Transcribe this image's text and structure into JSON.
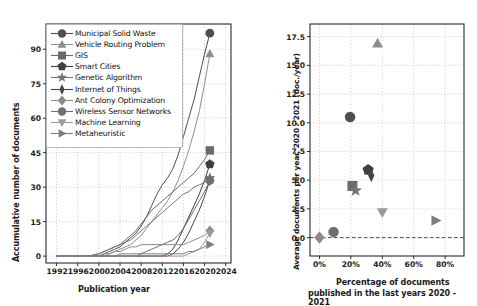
{
  "figure": {
    "title": "",
    "panels": [
      "accumulative-documents",
      "average-vs-percentage"
    ]
  },
  "series_names": [
    "Municipal Solid Waste",
    "Vehicle Routing Problem",
    "GIS",
    "Smart Cities",
    "Genetic Algorithm",
    "Internet of Things",
    "Ant Colony Optimization",
    "Wireless Sensor Networks",
    "Machine Learning",
    "Metaheuristic"
  ],
  "markers": [
    "circle",
    "triangle-up",
    "square",
    "pentagon",
    "star",
    "thin-diamond",
    "diamond",
    "circle",
    "triangle-down",
    "triangle-right"
  ],
  "colors": [
    "#4f4f4f",
    "#8e8e8e",
    "#6a6a6a",
    "#3f3f3f",
    "#757575",
    "#454545",
    "#8a8a8a",
    "#6f6f6f",
    "#9b9b9b",
    "#7e7e7e"
  ],
  "chart_data": [
    {
      "type": "line",
      "id": "accumulative-documents",
      "title": "",
      "xlabel": "Publication year",
      "ylabel": "Accumulative number of documents",
      "xlim": [
        1990,
        2025
      ],
      "ylim": [
        -3,
        101
      ],
      "xticks": [
        1992,
        1996,
        2000,
        2004,
        2008,
        2012,
        2016,
        2020,
        2024
      ],
      "yticks": [
        0,
        15,
        30,
        45,
        60,
        75,
        90
      ],
      "grid": true,
      "legend_position": "upper-left",
      "x": [
        1992,
        1994,
        1996,
        1998,
        2000,
        2001,
        2002,
        2003,
        2004,
        2005,
        2006,
        2007,
        2008,
        2009,
        2010,
        2011,
        2012,
        2013,
        2014,
        2015,
        2016,
        2017,
        2018,
        2019,
        2020,
        2021
      ],
      "series": [
        {
          "name": "Municipal Solid Waste",
          "values": [
            0,
            0,
            0,
            0,
            0,
            1,
            2,
            3,
            4,
            6,
            8,
            10,
            13,
            17,
            22,
            27,
            31,
            34,
            38,
            44,
            52,
            60,
            68,
            78,
            88,
            97
          ],
          "end": 97
        },
        {
          "name": "Vehicle Routing Problem",
          "values": [
            0,
            0,
            0,
            0,
            0,
            0,
            1,
            2,
            3,
            4,
            5,
            7,
            9,
            12,
            15,
            18,
            21,
            24,
            28,
            33,
            39,
            46,
            54,
            63,
            75,
            88
          ],
          "end": 88
        },
        {
          "name": "GIS",
          "values": [
            0,
            0,
            0,
            0,
            1,
            2,
            3,
            4,
            5,
            7,
            9,
            11,
            14,
            17,
            20,
            22,
            24,
            26,
            28,
            30,
            32,
            34,
            36,
            39,
            42,
            46
          ],
          "end": 46
        },
        {
          "name": "Smart Cities",
          "values": [
            0,
            0,
            0,
            0,
            0,
            0,
            0,
            0,
            0,
            0,
            0,
            0,
            0,
            0,
            0,
            0,
            0,
            1,
            3,
            7,
            12,
            17,
            22,
            27,
            33,
            40
          ],
          "end": 40
        },
        {
          "name": "Genetic Algorithm",
          "values": [
            0,
            0,
            0,
            0,
            1,
            2,
            3,
            4,
            5,
            6,
            7,
            9,
            11,
            13,
            15,
            17,
            19,
            21,
            23,
            25,
            27,
            28,
            30,
            31,
            32,
            34
          ],
          "end": 34
        },
        {
          "name": "Internet of Things",
          "values": [
            0,
            0,
            0,
            0,
            0,
            0,
            0,
            0,
            0,
            0,
            0,
            0,
            0,
            0,
            0,
            0,
            0,
            0,
            1,
            3,
            6,
            10,
            15,
            20,
            26,
            33
          ],
          "end": 33
        },
        {
          "name": "Ant Colony Optimization",
          "values": [
            0,
            0,
            0,
            0,
            0,
            1,
            1,
            2,
            2,
            3,
            4,
            4,
            5,
            5,
            5,
            5,
            5,
            5,
            5,
            5,
            5,
            6,
            7,
            8,
            9,
            11
          ],
          "end": 11
        },
        {
          "name": "Wireless Sensor Networks",
          "values": [
            0,
            0,
            0,
            0,
            0,
            0,
            0,
            0,
            0,
            0,
            0,
            0,
            1,
            2,
            3,
            4,
            5,
            6,
            7,
            9,
            12,
            16,
            20,
            24,
            28,
            33
          ],
          "end": 33
        },
        {
          "name": "Machine Learning",
          "values": [
            0,
            0,
            0,
            0,
            0,
            0,
            0,
            0,
            0,
            0,
            0,
            0,
            0,
            0,
            0,
            0,
            0,
            0,
            0,
            0,
            0,
            1,
            2,
            3,
            6,
            10
          ],
          "end": 10
        },
        {
          "name": "Metaheuristic",
          "values": [
            0,
            0,
            0,
            0,
            0,
            0,
            0,
            0,
            1,
            1,
            1,
            1,
            1,
            1,
            1,
            1,
            1,
            1,
            1,
            1,
            1,
            2,
            2,
            3,
            4,
            5
          ],
          "end": 5
        }
      ]
    },
    {
      "type": "scatter",
      "id": "average-vs-percentage",
      "title": "",
      "xlabel": "Percentage of documents\npublished in the last years 2020 - 2021",
      "xlabel_line1": "Percentage of documents",
      "xlabel_line2": "published in the last years 2020 - 2021",
      "ylabel": "Average documents per year, 2020 - 2021 (doc./year)",
      "xlim": [
        -6,
        92
      ],
      "ylim": [
        -1.6,
        18.6
      ],
      "xticks": [
        0,
        20,
        40,
        60,
        80
      ],
      "xticklabels": [
        "0%",
        "20%",
        "40%",
        "60%",
        "80%"
      ],
      "yticks": [
        0.0,
        2.5,
        5.0,
        7.5,
        10.0,
        12.5,
        15.0,
        17.5
      ],
      "yticklabels": [
        "0.0",
        "2.5",
        "5.0",
        "7.5",
        "10.0",
        "12.5",
        "15.0",
        "17.5"
      ],
      "grid": true,
      "hline": 0,
      "points": [
        {
          "name": "Municipal Solid Waste",
          "x": 19.5,
          "y": 10.5,
          "marker": "circle"
        },
        {
          "name": "Vehicle Routing Problem",
          "x": 37.0,
          "y": 16.9,
          "marker": "triangle-up"
        },
        {
          "name": "GIS",
          "x": 21.0,
          "y": 4.5,
          "marker": "square"
        },
        {
          "name": "Smart Cities",
          "x": 31.0,
          "y": 5.9,
          "marker": "pentagon"
        },
        {
          "name": "Genetic Algorithm",
          "x": 23.0,
          "y": 4.1,
          "marker": "star"
        },
        {
          "name": "Internet of Things",
          "x": 33.0,
          "y": 5.4,
          "marker": "thin-diamond"
        },
        {
          "name": "Ant Colony Optimization",
          "x": 0.0,
          "y": 0.0,
          "marker": "diamond"
        },
        {
          "name": "Wireless Sensor Networks",
          "x": 9.0,
          "y": 0.5,
          "marker": "circle"
        },
        {
          "name": "Machine Learning",
          "x": 40.0,
          "y": 2.2,
          "marker": "triangle-down"
        },
        {
          "name": "Metaheuristic",
          "x": 74.0,
          "y": 1.5,
          "marker": "triangle-right"
        }
      ]
    }
  ]
}
